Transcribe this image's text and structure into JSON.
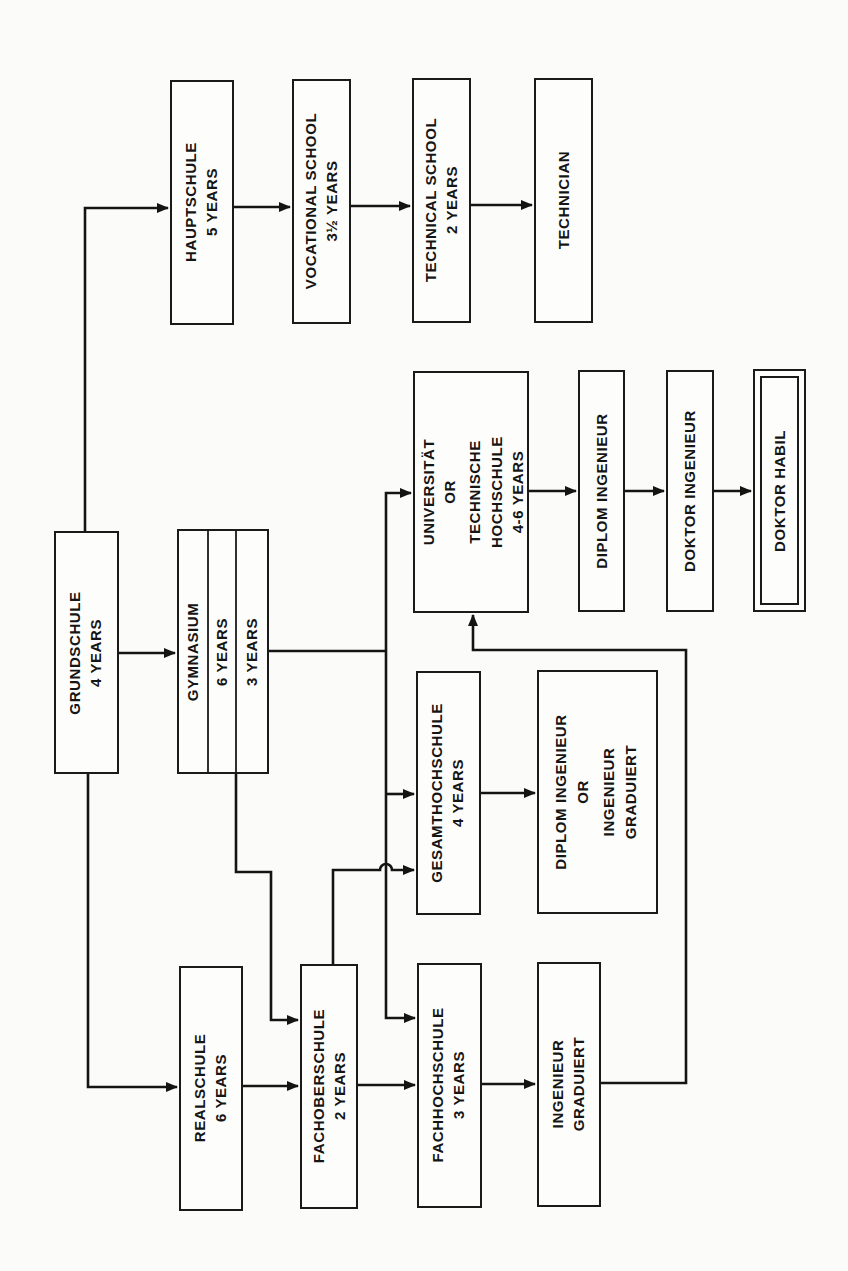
{
  "diagram": {
    "orientation": "rotated 90 degrees counter-clockwise",
    "colors": {
      "line": "#141414",
      "box_stroke": "#1a1a1a",
      "background": "#fbfbf9"
    },
    "nodes": {
      "grundschule": {
        "line1": "GRUNDSCHULE",
        "line2": "4 YEARS"
      },
      "hauptschule": {
        "line1": "HAUPTSCHULE",
        "line2": "5 YEARS"
      },
      "vocational": {
        "line1": "VOCATIONAL SCHOOL",
        "line2": "3½ YEARS"
      },
      "technical": {
        "line1": "TECHNICAL SCHOOL",
        "line2": "2 YEARS"
      },
      "technician": {
        "line1": "TECHNICIAN"
      },
      "gymnasium": {
        "col1": "GYMNASIUM",
        "col2": "6 YEARS",
        "col3": "3 YEARS"
      },
      "universitaet": {
        "line1": "UNIVERSITÄT",
        "line2": "OR",
        "line3": "TECHNISCHE",
        "line4": "HOCHSCHULE",
        "line5": "4-6 YEARS"
      },
      "diplom_ingenieur": {
        "line1": "DIPLOM INGENIEUR"
      },
      "doktor_ingenieur": {
        "line1": "DOKTOR INGENIEUR"
      },
      "doktor_habil": {
        "line1": "DOKTOR HABIL"
      },
      "gesamthochschule": {
        "line1": "GESAMTHOCHSCHULE",
        "line2": "4 YEARS"
      },
      "diplom_or_graduiert": {
        "line1": "DIPLOM INGENIEUR",
        "line2": "OR",
        "line3": "INGENIEUR",
        "line4": "GRADUIERT"
      },
      "realschule": {
        "line1": "REALSCHULE",
        "line2": "6 YEARS"
      },
      "fachoberschule": {
        "line1": "FACHOBERSCHULE",
        "line2": "2 YEARS"
      },
      "fachhochschule": {
        "line1": "FACHHOCHSCHULE",
        "line2": "3 YEARS"
      },
      "ingenieur_graduiert": {
        "line1": "INGENIEUR",
        "line2": "GRADUIERT"
      }
    },
    "edges": [
      {
        "from": "GRUNDSCHULE",
        "to": "HAUPTSCHULE"
      },
      {
        "from": "HAUPTSCHULE",
        "to": "VOCATIONAL SCHOOL"
      },
      {
        "from": "VOCATIONAL SCHOOL",
        "to": "TECHNICAL SCHOOL"
      },
      {
        "from": "TECHNICAL SCHOOL",
        "to": "TECHNICIAN"
      },
      {
        "from": "GRUNDSCHULE",
        "to": "GYMNASIUM"
      },
      {
        "from": "GRUNDSCHULE",
        "to": "REALSCHULE"
      },
      {
        "from": "GYMNASIUM",
        "to": "UNIVERSITÄT OR TECHNISCHE HOCHSCHULE"
      },
      {
        "from": "GYMNASIUM",
        "to": "GESAMTHOCHSCHULE"
      },
      {
        "from": "GYMNASIUM",
        "to": "FACHHOCHSCHULE"
      },
      {
        "from": "GYMNASIUM (6 YEARS)",
        "to": "FACHOBERSCHULE"
      },
      {
        "from": "UNIVERSITÄT OR TECHNISCHE HOCHSCHULE",
        "to": "DIPLOM INGENIEUR"
      },
      {
        "from": "DIPLOM INGENIEUR",
        "to": "DOKTOR INGENIEUR"
      },
      {
        "from": "DOKTOR INGENIEUR",
        "to": "DOKTOR HABIL"
      },
      {
        "from": "GESAMTHOCHSCHULE",
        "to": "DIPLOM INGENIEUR OR INGENIEUR GRADUIERT"
      },
      {
        "from": "REALSCHULE",
        "to": "FACHOBERSCHULE"
      },
      {
        "from": "FACHOBERSCHULE",
        "to": "FACHHOCHSCHULE"
      },
      {
        "from": "FACHOBERSCHULE",
        "to": "GESAMTHOCHSCHULE"
      },
      {
        "from": "FACHHOCHSCHULE",
        "to": "INGENIEUR GRADUIERT"
      },
      {
        "from": "INGENIEUR GRADUIERT",
        "to": "UNIVERSITÄT OR TECHNISCHE HOCHSCHULE"
      }
    ]
  }
}
